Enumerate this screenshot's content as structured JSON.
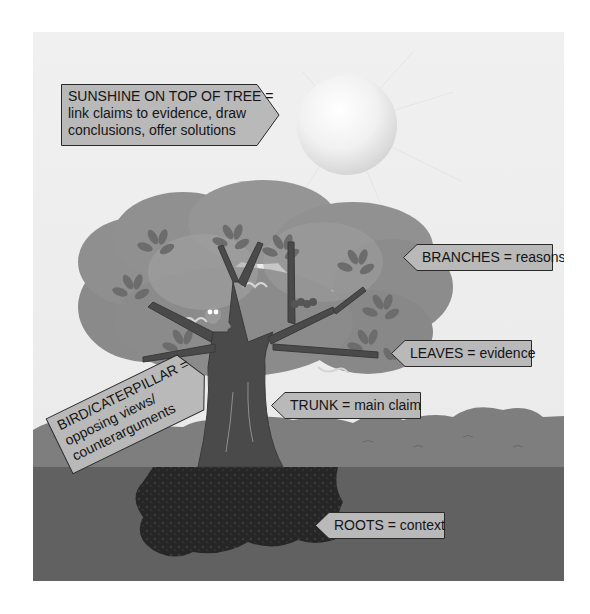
{
  "diagram": {
    "labels": {
      "sunshine": {
        "line1": "SUNSHINE ON TOP OF TREE =",
        "line2": "link claims to evidence, draw",
        "line3": "conclusions, offer solutions"
      },
      "branches": "BRANCHES = reasons",
      "leaves": "LEAVES = evidence",
      "trunk": "TRUNK = main claim",
      "roots": "ROOTS = context",
      "bird_caterpillar": {
        "line1": "BIRD/CATERPILLAR =",
        "line2": "opposing views/",
        "line3": "counterarguments"
      }
    },
    "colors": {
      "background": "#ededed",
      "label_fill": "#b9b9b9",
      "label_border": "#2a2a2a",
      "crown": "#8d8d8d",
      "crown_light": "#a4a4a4",
      "leaf": "#6c6c6c",
      "trunk": "#4a4a4a",
      "grass": "#7a7a7a",
      "soil": "#5f5f5f",
      "roots": "#262626",
      "sun": "#f6f6f6"
    }
  }
}
